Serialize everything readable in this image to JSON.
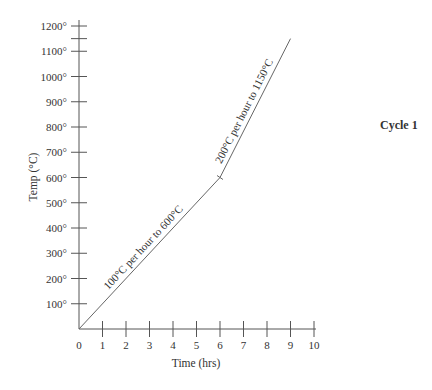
{
  "chart_data": {
    "type": "line",
    "title": "Cycle 1",
    "xlabel": "Time (hrs)",
    "ylabel": "Temp (°C)",
    "xlim": [
      0,
      10
    ],
    "ylim": [
      0,
      1200
    ],
    "x_ticks": [
      "0",
      "1",
      "2",
      "3",
      "4",
      "5",
      "6",
      "7",
      "8",
      "9",
      "10"
    ],
    "y_ticks": [
      "100°",
      "200°",
      "300°",
      "400°",
      "500°",
      "600°",
      "700°",
      "800°",
      "900°",
      "1000°",
      "1100°",
      "1200°"
    ],
    "extra_y_tick": 1150,
    "grid": false,
    "series": [
      {
        "name": "Cycle 1",
        "x": [
          0,
          6,
          9
        ],
        "y": [
          0,
          600,
          1150
        ]
      }
    ],
    "annotations": [
      {
        "text": "100°C per hour to 600°C",
        "segment": [
          [
            0,
            0
          ],
          [
            6,
            600
          ]
        ]
      },
      {
        "text": "200°C per hour to 1150°C",
        "segment": [
          [
            6,
            600
          ],
          [
            9,
            1150
          ]
        ]
      }
    ]
  }
}
